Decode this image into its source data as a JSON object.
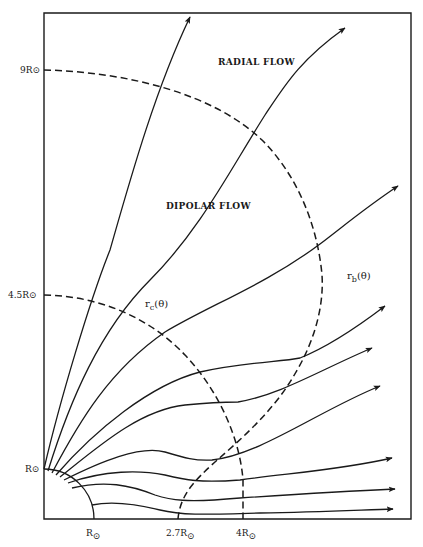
{
  "diagram": {
    "frame_color": "#1a1a1a",
    "regions": {
      "radial": "RADIAL FLOW",
      "dipolar": "DIPOLAR FLOW"
    },
    "boundaries": {
      "rc_label": "r",
      "rc_sub": "c",
      "rc_arg": "(θ)",
      "rb_label": "r",
      "rb_sub": "b",
      "rb_arg": "(θ)"
    },
    "axis_labels": {
      "left": [
        {
          "value": "9R",
          "symbol": "⊙"
        },
        {
          "value": "4.5R",
          "symbol": "⊙"
        },
        {
          "value": "R",
          "symbol": "⊙"
        }
      ],
      "bottom": [
        {
          "value": "R",
          "symbol": "⊙"
        },
        {
          "value": "2.7R",
          "symbol": "⊙"
        },
        {
          "value": "4R",
          "symbol": "⊙"
        }
      ]
    },
    "field_lines_count": 10,
    "dashed_curves": [
      "r_c(θ) inner boundary",
      "r_b(θ) outer boundary",
      "x = 2.7R vertical",
      "x = 4R vertical"
    ]
  }
}
